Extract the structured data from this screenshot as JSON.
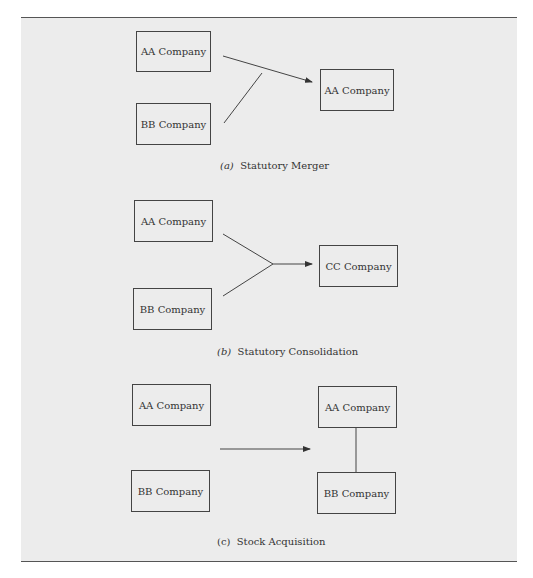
{
  "panels": {
    "a": {
      "caption_letter": "(a)",
      "caption_text": "Statutory Merger",
      "boxes": [
        "AA Company",
        "BB Company",
        "AA Company"
      ]
    },
    "b": {
      "caption_letter": "(b)",
      "caption_text": "Statutory Consolidation",
      "boxes": [
        "AA Company",
        "BB Company",
        "CC Company"
      ]
    },
    "c": {
      "caption_letter": "(c)",
      "caption_text": "Stock Acquisition",
      "boxes": [
        "AA Company",
        "BB Company",
        "AA Company",
        "BB Company"
      ]
    }
  },
  "colors": {
    "background": "#ececec",
    "line": "#444444",
    "rule": "#555555"
  }
}
